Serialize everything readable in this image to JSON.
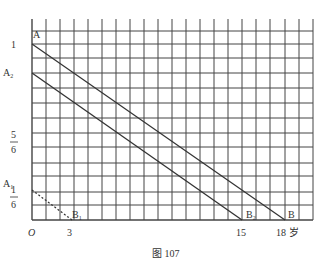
{
  "figure": {
    "caption": "图 107",
    "grid": {
      "x0": 32,
      "x1": 313,
      "y0": 19,
      "y1": 220,
      "vlines": [
        32,
        46,
        60,
        74,
        88,
        102,
        116,
        130,
        144,
        158,
        172,
        186,
        200,
        214,
        228,
        242,
        256,
        270,
        285,
        299,
        313
      ],
      "hlines": [
        31,
        44,
        58,
        73,
        88,
        103,
        118,
        133,
        147,
        163,
        176,
        192,
        205,
        220
      ],
      "stroke": "#444444"
    },
    "x_axis": {
      "origin_label": "O",
      "ticks": [
        {
          "label": "3",
          "x": 70
        },
        {
          "label": "15",
          "x": 242
        },
        {
          "label": "18 岁",
          "x": 291
        }
      ],
      "unit": "岁"
    },
    "y_axis": {
      "labels": [
        {
          "label": "1",
          "y": 44
        },
        {
          "label": "5/6",
          "num": "5",
          "den": "6",
          "y": 142
        },
        {
          "label": "1/6",
          "num": "1",
          "den": "6",
          "y": 197
        }
      ]
    },
    "lines": [
      {
        "name": "AB",
        "from": "A",
        "to": "B",
        "x1": 32,
        "y1": 44,
        "x2": 285,
        "y2": 220,
        "style": "solid"
      },
      {
        "name": "A2B2",
        "from": "A2",
        "to": "B2",
        "x1": 32,
        "y1": 73,
        "x2": 242,
        "y2": 220,
        "style": "solid"
      },
      {
        "name": "A1B1",
        "from": "A1",
        "to": "B1",
        "x1": 32,
        "y1": 190,
        "x2": 72,
        "y2": 220,
        "style": "dashed"
      }
    ],
    "points": {
      "A": "A",
      "A2": "A",
      "A2_sub": "2",
      "A1": "A",
      "A1_sub": "1",
      "B": "B",
      "B2": "B",
      "B2_sub": "2",
      "B1": "B",
      "B1_sub": "1"
    }
  }
}
